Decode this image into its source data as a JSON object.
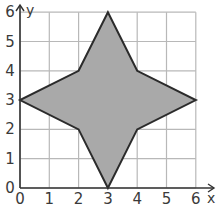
{
  "chart_data": {
    "type": "polygon-on-grid",
    "title": "",
    "xlabel": "x",
    "ylabel": "y",
    "xlim": [
      0,
      6
    ],
    "ylim": [
      0,
      6
    ],
    "grid": true,
    "x_ticks": [
      "0",
      "1",
      "2",
      "3",
      "4",
      "5",
      "6"
    ],
    "y_ticks": [
      "0",
      "1",
      "2",
      "3",
      "4",
      "5",
      "6"
    ],
    "polygon": {
      "vertices": [
        [
          3,
          6
        ],
        [
          4,
          4
        ],
        [
          6,
          3
        ],
        [
          4,
          2
        ],
        [
          3,
          0
        ],
        [
          2,
          2
        ],
        [
          0,
          3
        ],
        [
          2,
          4
        ]
      ],
      "fill": "#a9a9a9",
      "stroke": "#2b2b2b"
    }
  },
  "labels": {
    "x_axis": "x",
    "y_axis": "y",
    "x_ticks": [
      "0",
      "1",
      "2",
      "3",
      "4",
      "5",
      "6"
    ],
    "y_ticks": [
      "0",
      "1",
      "2",
      "3",
      "4",
      "5",
      "6"
    ]
  },
  "colors": {
    "grid": "#b8b8b8",
    "axis": "#333333",
    "shape_fill": "#a9a9a9",
    "shape_stroke": "#2b2b2b"
  }
}
